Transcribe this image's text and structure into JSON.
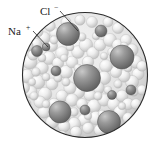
{
  "figure": {
    "background_color": "#ffffff",
    "outline_color": "#2b2b2b",
    "solvent_color": "#e8e8e8",
    "ion_color": "#8a8a8a",
    "ion_dark_color": "#6e6e6e",
    "highlight_color": "#f6f6f6"
  },
  "labels": [
    {
      "id": "cl-label",
      "symbol": "Cl",
      "charge": "−",
      "full_text": "Cl−",
      "x": 46,
      "y": 13,
      "leader_from": [
        60,
        10
      ],
      "leader_to": [
        77,
        30
      ]
    },
    {
      "id": "na-label",
      "symbol": "Na",
      "charge": "+",
      "full_text": "Na+",
      "x": 10,
      "y": 33,
      "leader_from": [
        33,
        31
      ],
      "leader_to": [
        47,
        46
      ]
    }
  ],
  "container": {
    "shape": "circle",
    "center_x": 85,
    "center_y": 75,
    "radius": 63
  },
  "ions": [
    {
      "cx": 68,
      "cy": 34,
      "r": 11.5,
      "species": "Cl-"
    },
    {
      "cx": 101,
      "cy": 31,
      "r": 6.0,
      "species": "Na+"
    },
    {
      "cx": 37,
      "cy": 51,
      "r": 5.5,
      "species": "Na+"
    },
    {
      "cx": 122,
      "cy": 57,
      "r": 12.0,
      "species": "Cl-"
    },
    {
      "cx": 87,
      "cy": 78,
      "r": 13.5,
      "species": "Cl-"
    },
    {
      "cx": 56,
      "cy": 71,
      "r": 5.0,
      "species": "Na+"
    },
    {
      "cx": 131,
      "cy": 90,
      "r": 5.0,
      "species": "Na+"
    },
    {
      "cx": 60,
      "cy": 112,
      "r": 11.0,
      "species": "Cl-"
    },
    {
      "cx": 85,
      "cy": 110,
      "r": 5.0,
      "species": "Na+"
    },
    {
      "cx": 109,
      "cy": 122,
      "r": 11.5,
      "species": "Cl-"
    },
    {
      "cx": 46,
      "cy": 47,
      "r": 4.0,
      "species": "Na+"
    },
    {
      "cx": 112,
      "cy": 95,
      "r": 4.5,
      "species": "Na+"
    }
  ],
  "solvent": {
    "name": "water molecules",
    "description": "small pale spheres filling the droplet"
  }
}
